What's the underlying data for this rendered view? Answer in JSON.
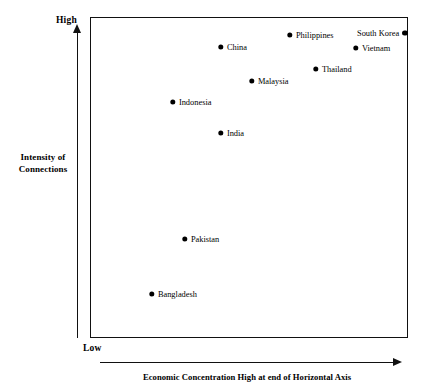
{
  "chart_data": {
    "type": "scatter",
    "title": "",
    "xlabel": "Economic Concentration High at end of Horizontal Axis",
    "ylabel": "Intensity of Connections",
    "y_axis_high_label": "High",
    "y_axis_low_label": "Low",
    "grid": false,
    "legend": "none",
    "xlim": [
      0,
      100
    ],
    "ylim": [
      0,
      100
    ],
    "axis_note": "Qualitative conceptual axes; positions read from pixel coordinates and normalised 0-100 within the plot frame.",
    "points": [
      {
        "label": "Philippines",
        "x": 62.6,
        "y": 94.7,
        "px": 289,
        "py": 34,
        "label_side": "right"
      },
      {
        "label": "South Korea",
        "x": 98.7,
        "y": 95.3,
        "px": 404,
        "py": 32,
        "label_side": "left"
      },
      {
        "label": "China",
        "x": 40.9,
        "y": 91.0,
        "px": 220,
        "py": 46,
        "label_side": "right"
      },
      {
        "label": "Vietnam",
        "x": 83.3,
        "y": 90.7,
        "px": 355,
        "py": 47,
        "label_side": "right"
      },
      {
        "label": "Thailand",
        "x": 70.8,
        "y": 84.1,
        "px": 315,
        "py": 68,
        "label_side": "right"
      },
      {
        "label": "Malaysia",
        "x": 50.6,
        "y": 80.4,
        "px": 251,
        "py": 80,
        "label_side": "right"
      },
      {
        "label": "Indonesia",
        "x": 25.8,
        "y": 73.8,
        "px": 172,
        "py": 101,
        "label_side": "right"
      },
      {
        "label": "India",
        "x": 40.9,
        "y": 64.2,
        "px": 220,
        "py": 132,
        "label_side": "right"
      },
      {
        "label": "Pakistan",
        "x": 29.6,
        "y": 31.2,
        "px": 184,
        "py": 238,
        "label_side": "right"
      },
      {
        "label": "Bangladesh",
        "x": 19.2,
        "y": 14.0,
        "px": 151,
        "py": 293,
        "label_side": "right"
      }
    ]
  },
  "axes": {
    "y": {
      "high_label": "High",
      "low_label": "Low",
      "title_line1": "Intensity of",
      "title_line2": "Connections"
    },
    "x": {
      "title": "Economic Concentration High at end of Horizontal Axis"
    }
  }
}
